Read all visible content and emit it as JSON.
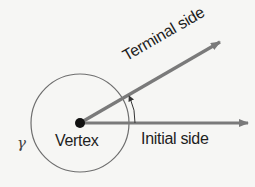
{
  "diagram": {
    "labels": {
      "terminal_side": "Terminal side",
      "initial_side": "Initial side",
      "vertex": "Vertex",
      "angle_symbol": "γ"
    },
    "colors": {
      "rays": "#7a7a7a",
      "circle": "#6e6e6e",
      "vertex_dot": "#111111",
      "text": "#1e1e1e",
      "background": "#f6f6f4"
    },
    "geometry": {
      "vertex": [
        80,
        123
      ],
      "circle_radius": 50,
      "initial_side_end": [
        250,
        123
      ],
      "terminal_side_end": [
        222,
        41
      ],
      "terminal_angle_deg": 30
    }
  }
}
